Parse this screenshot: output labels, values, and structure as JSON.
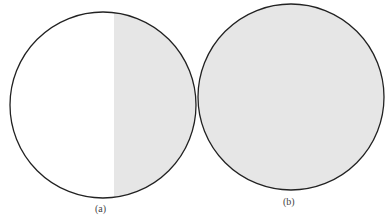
{
  "figures": [
    {
      "label": "(a)",
      "description": "circle half shaded (right side)",
      "shade_color": "#e6e6e6"
    },
    {
      "label": "(b)",
      "description": "circle fully shaded",
      "shade_color": "#e6e6e6"
    }
  ],
  "colors": {
    "outline": "#222222",
    "shade": "#e6e6e6",
    "background": "#ffffff"
  }
}
